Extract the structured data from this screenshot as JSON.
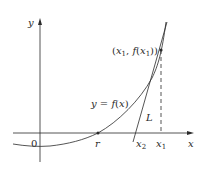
{
  "diagram": {
    "axes": {
      "x_label": "x",
      "y_label": "y",
      "origin_label": "0"
    },
    "curve": {
      "label": "y = f(x)",
      "label_parts": {
        "y": "y",
        "eq": " = ",
        "f": "f",
        "open": "(",
        "x": "x",
        "close": ")"
      }
    },
    "point": {
      "label_open": "(",
      "x": "x",
      "sub1": "1",
      "comma": ", ",
      "f": "f",
      "inner_open": "(",
      "inner_close": "))"
    },
    "tangent": {
      "label": "L"
    },
    "x_ticks": [
      {
        "label": "r",
        "sub": ""
      },
      {
        "label": "x",
        "sub": "2"
      },
      {
        "label": "x",
        "sub": "1"
      }
    ],
    "colors": {
      "stroke": "#2a2a2a",
      "background": "#ffffff"
    }
  }
}
